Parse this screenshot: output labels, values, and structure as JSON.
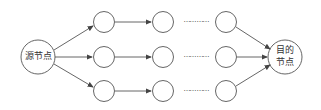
{
  "diagram": {
    "source_node": {
      "label": "源节点"
    },
    "target_node": {
      "label_line1": "目的",
      "label_line2": "节点"
    },
    "ellipsis": "…… ……",
    "rows": 3,
    "intermediate_columns": 3,
    "colors": {
      "stroke": "#555555",
      "text": "#333333",
      "background": "#ffffff"
    }
  }
}
